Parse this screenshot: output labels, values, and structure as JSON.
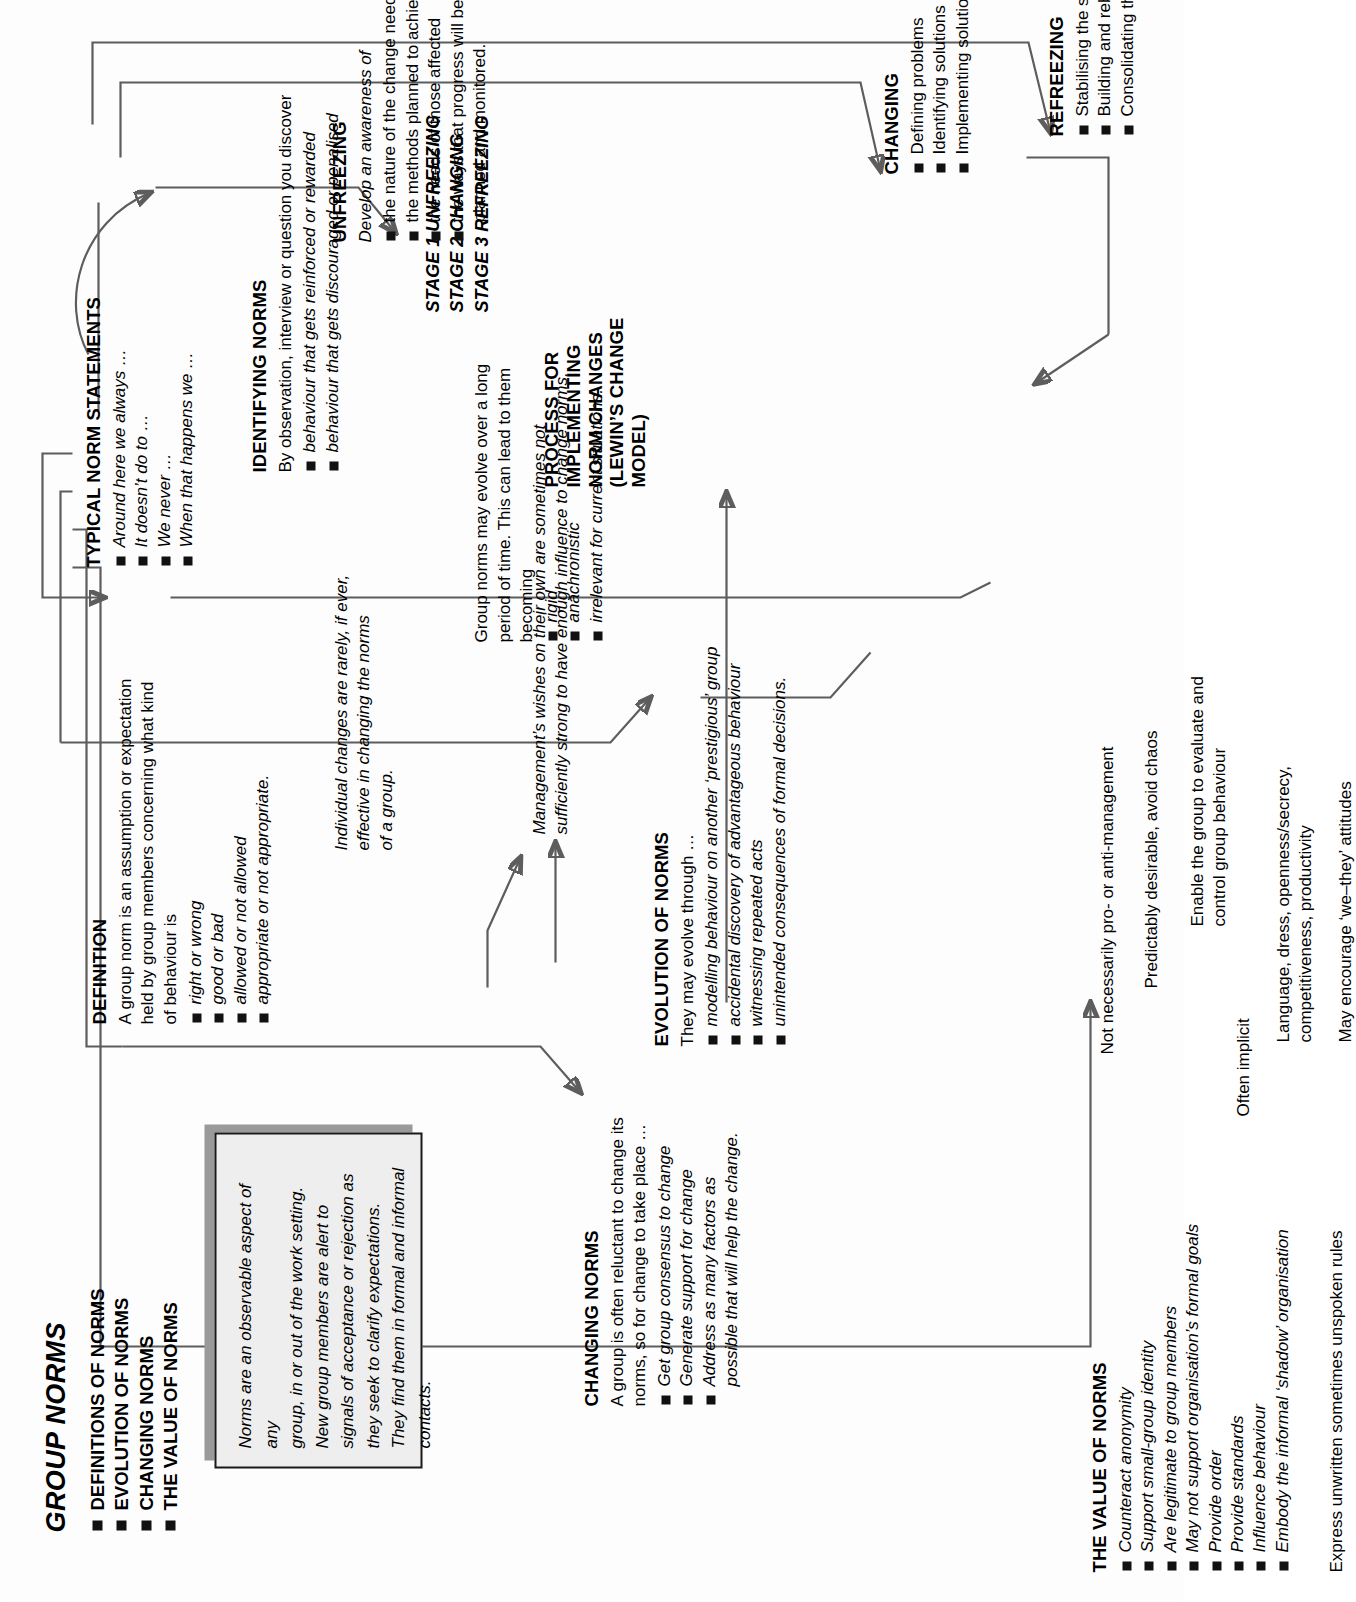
{
  "doc": {
    "title": "GROUP NORMS",
    "contents": [
      "DEFINITIONS OF NORMS",
      "EVOLUTION OF NORMS",
      "CHANGING NORMS",
      "THE VALUE OF NORMS"
    ]
  },
  "callout": {
    "text": "Norms are an observable aspect of any\ngroup, in or out of the work setting.\nNew group members are alert to\nsignals of acceptance or rejection as\nthey seek to clarify expectations.\nThey find them in formal and informal\ncontacts."
  },
  "definition": {
    "title": "DEFINITION",
    "lead": "A group norm is an assumption or expectation\nheld by group members concerning what kind\nof behaviour is",
    "bullets": [
      "right or wrong",
      "good or bad",
      "allowed or not allowed",
      "appropriate or not appropriate."
    ]
  },
  "typical_norm_statements": {
    "title": "TYPICAL NORM STATEMENTS",
    "bullets": [
      "Around here we always …",
      "It doesn’t do to …",
      "We never …",
      "When that happens we …"
    ]
  },
  "identifying_norms": {
    "title": "IDENTIFYING NORMS",
    "lead": "By observation, interview or question you discover",
    "bullets": [
      "behaviour that gets reinforced or rewarded",
      "behaviour that gets discouraged or penalised"
    ]
  },
  "evolution_of_norms": {
    "title": "EVOLUTION OF NORMS",
    "lead": "They may evolve through …",
    "bullets": [
      "modelling behaviour on another ‘prestigious’ group",
      "accidental discovery of advantageous behaviour",
      "witnessing repeated acts",
      "unintended consequences of formal decisions."
    ]
  },
  "evolution_note": {
    "lead": "Group norms may evolve over a long\nperiod of time. This can lead to them\nbecoming",
    "bullets": [
      "rigid",
      "anachronistic",
      "irrelevant for current situations."
    ]
  },
  "changing_norms": {
    "title": "CHANGING NORMS",
    "lead": "A group is often reluctant to change its\nnorms, so for change to take place …",
    "bullets": [
      "Get group consensus to change",
      "Generate support for change",
      "Address as many factors as\npossible that will help the change."
    ]
  },
  "management_note": {
    "text": "Management’s wishes on their own are sometimes not\nsufficiently strong to have enough influence to change norms."
  },
  "individual_note": {
    "text": "Individual changes are rarely, if ever,\neffective in changing the norms\nof a group."
  },
  "process": {
    "title": "PROCESS FOR\nIMPLEMENTING\nNORM CHANGES\n(LEWIN’S CHANGE\nMODEL)",
    "stages": [
      "STAGE 1 UNFREEZING",
      "STAGE 2 CHANGING",
      "STAGE 3 REFREEZING"
    ]
  },
  "unfreezing": {
    "title": "UNFREEZING",
    "lead": "Develop an awareness of",
    "bullets": [
      "the nature of the change needed",
      "the methods planned to achieve the change",
      "the needs of those affected",
      "the ways that progress will be\nplanned and monitored."
    ]
  },
  "changing": {
    "title": "CHANGING",
    "bullets": [
      "Defining problems",
      "Identifying solutions",
      "Implementing solutions"
    ]
  },
  "refreezing": {
    "title": "REFREEZING",
    "bullets": [
      "Stabilising the situation",
      "Building and rebuilding relationships",
      "Consolidating the systems"
    ]
  },
  "value_of_norms": {
    "title": "THE VALUE OF NORMS",
    "bullets": [
      "Counteract anonymity",
      "Support small-group identity",
      "Are legitimate to group members",
      "May not support organisation’s formal goals",
      "Provide order",
      "Provide standards",
      "Influence behaviour",
      "Embody the informal ‘shadow’ organisation"
    ],
    "annotations": [
      "Not necessarily pro- or anti-management",
      "Predictably desirable, avoid chaos",
      "Enable the group to evaluate and\ncontrol group behaviour",
      "Often implicit",
      "Language, dress, openness/secrecy,\ncompetitiveness, productivity",
      "May encourage ‘we–they’ attitudes"
    ],
    "footer": "Express unwritten sometimes unspoken rules"
  },
  "colors": {
    "ink": "#111111",
    "wire": "#5d5d5d",
    "callout_fill": "#eeeeee",
    "callout_shadow": "#9a9a9a"
  }
}
